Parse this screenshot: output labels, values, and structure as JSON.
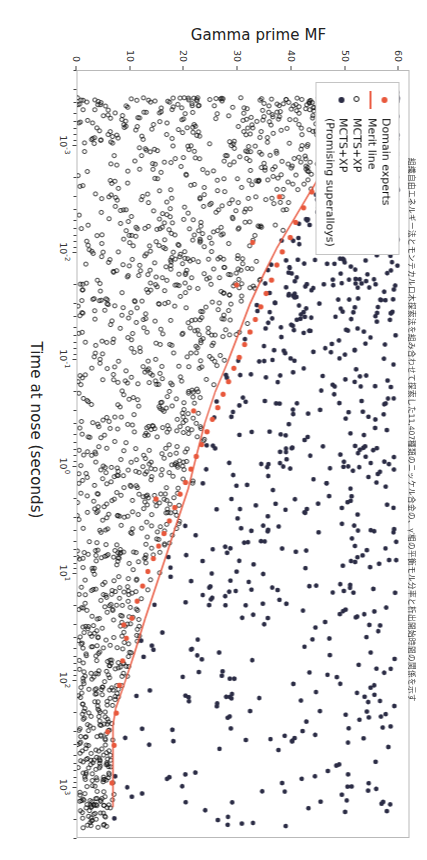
{
  "figure": {
    "orientation_degrees": 90,
    "caption": "組織自由エネルギー法とモンテカルロ木探索法を組み合わせて探索した11,407種類のニッケル合金の、γ′相の平衡モル分率と析出開始時間の関係を示す"
  },
  "legend": {
    "title": "",
    "items": [
      {
        "label": "Domain experts",
        "marker": "filled-circle-icon",
        "color": "#e8583c"
      },
      {
        "label": "Merit line",
        "marker": "line-icon",
        "color": "#ea5a41"
      },
      {
        "label": "MCTS+XP",
        "marker": "open-circle-icon",
        "color": "#111111"
      },
      {
        "label": "MCTS+XP\n(Promising superalloys)",
        "marker": "filled-circle-icon",
        "color": "#2b2c45"
      }
    ]
  },
  "chart_data": {
    "type": "scatter",
    "title": "",
    "xlabel": "Time at nose (seconds)",
    "ylabel": "Gamma prime MF",
    "xscale": "log",
    "yscale": "linear",
    "xlim": [
      0.0002,
      3000
    ],
    "ylim": [
      0,
      62
    ],
    "grid": false,
    "legend_position": "top-left",
    "xticks": [
      {
        "value": 0.001,
        "label": "10-3"
      },
      {
        "value": 0.01,
        "label": "10-2"
      },
      {
        "value": 0.1,
        "label": "10-1"
      },
      {
        "value": 1,
        "label": "100"
      },
      {
        "value": 10,
        "label": "101"
      },
      {
        "value": 100,
        "label": "102"
      },
      {
        "value": 1000,
        "label": "103"
      }
    ],
    "xtick_exponents": [
      "-3",
      "-2",
      "-1",
      "0",
      "1",
      "2",
      "3"
    ],
    "xtick_mantissa": "10",
    "yticks": [
      0,
      10,
      20,
      30,
      40,
      50,
      60
    ],
    "series": [
      {
        "name": "MCTS+XP",
        "marker": "open-circle",
        "color": "#111111",
        "n_points": 1400,
        "description": "Large cloud of open circles concentrated at short nose times (1e-4 to 1e0) and low-to-mid gamma prime MF (0-35), thinning toward long times."
      },
      {
        "name": "MCTS+XP (Promising superalloys)",
        "marker": "filled-circle",
        "color": "#2b2c45",
        "n_points": 900,
        "description": "Dark navy filled circles, dense at low nose time with high gamma prime MF (25-60), scattered across the full time range above the merit line."
      },
      {
        "name": "Domain experts",
        "marker": "filled-circle",
        "color": "#e8583c",
        "n_points": 52,
        "points": [
          [
            0.00035,
            55.0
          ],
          [
            0.0006,
            51.5
          ],
          [
            0.0009,
            49.0
          ],
          [
            0.0013,
            47.0
          ],
          [
            0.0019,
            45.5
          ],
          [
            0.0027,
            44.0
          ],
          [
            0.0038,
            42.5
          ],
          [
            0.0052,
            41.0
          ],
          [
            0.0072,
            40.0
          ],
          [
            0.0098,
            38.5
          ],
          [
            0.013,
            37.5
          ],
          [
            0.018,
            36.5
          ],
          [
            0.024,
            35.5
          ],
          [
            0.032,
            34.5
          ],
          [
            0.042,
            33.5
          ],
          [
            0.055,
            32.5
          ],
          [
            0.072,
            31.5
          ],
          [
            0.095,
            30.5
          ],
          [
            0.12,
            29.5
          ],
          [
            0.16,
            28.5
          ],
          [
            0.21,
            27.5
          ],
          [
            0.28,
            26.5
          ],
          [
            0.36,
            25.5
          ],
          [
            0.47,
            24.5
          ],
          [
            0.62,
            23.5
          ],
          [
            0.8,
            22.5
          ],
          [
            1.05,
            21.5
          ],
          [
            1.4,
            20.5
          ],
          [
            1.8,
            19.5
          ],
          [
            2.4,
            18.5
          ],
          [
            3.2,
            17.5
          ],
          [
            4.2,
            16.5
          ],
          [
            5.5,
            15.5
          ],
          [
            7.2,
            14.5
          ],
          [
            9.5,
            13.5
          ],
          [
            13,
            12.5
          ],
          [
            18,
            11.5
          ],
          [
            26,
            10.5
          ],
          [
            40,
            9.5
          ],
          [
            65,
            8.8
          ],
          [
            110,
            8.2
          ],
          [
            200,
            7.6
          ],
          [
            400,
            7.2
          ],
          [
            900,
            6.8
          ],
          [
            0.003,
            38.0
          ],
          [
            0.02,
            30.0
          ],
          [
            0.3,
            22.0
          ],
          [
            2.0,
            15.0
          ],
          [
            30,
            9.0
          ],
          [
            300,
            6.0
          ],
          [
            0.0004,
            46.0
          ],
          [
            0.008,
            33.0
          ]
        ]
      },
      {
        "name": "Merit line",
        "marker": "line",
        "color": "#ea5a41",
        "description": "Monotonic Pareto frontier: starts near gamma prime MF 58 at 3e-4 s, decays steeply through 35 at 1e-2 s, 22 at 1 s, 12 at 50 s, and flattens near 6-7 beyond 200 s.",
        "points": [
          [
            0.00028,
            58.0
          ],
          [
            0.0005,
            53.0
          ],
          [
            0.0009,
            49.5
          ],
          [
            0.0016,
            46.5
          ],
          [
            0.0028,
            43.5
          ],
          [
            0.005,
            40.5
          ],
          [
            0.009,
            37.5
          ],
          [
            0.016,
            35.0
          ],
          [
            0.03,
            32.5
          ],
          [
            0.055,
            30.5
          ],
          [
            0.1,
            28.5
          ],
          [
            0.2,
            26.0
          ],
          [
            0.4,
            24.0
          ],
          [
            0.8,
            22.5
          ],
          [
            1.6,
            21.0
          ],
          [
            3.2,
            19.0
          ],
          [
            6.5,
            17.0
          ],
          [
            13,
            15.0
          ],
          [
            26,
            13.0
          ],
          [
            55,
            11.0
          ],
          [
            110,
            9.0
          ],
          [
            180,
            7.5
          ],
          [
            260,
            7.0
          ],
          [
            1500,
            7.0
          ]
        ]
      }
    ]
  }
}
